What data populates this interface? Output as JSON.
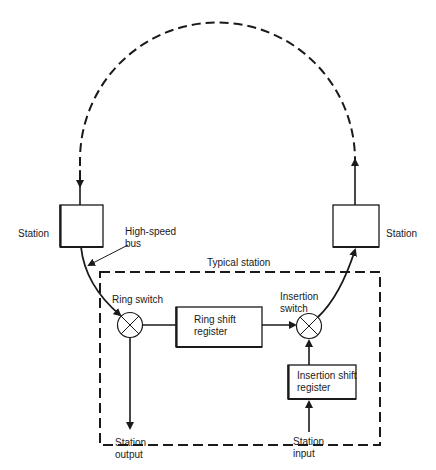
{
  "diagram": {
    "type": "ring network block diagram",
    "labels": {
      "station_left": "Station",
      "station_right": "Station",
      "high_speed_bus": "High-speed\nbus",
      "typical_station": "Typical station",
      "ring_switch": "Ring switch",
      "ring_shift_register": "Ring shift\nregister",
      "insertion_switch": "Insertion\nswitch",
      "insertion_shift_register": "Insertion shift\nregister",
      "station_output": "Station\noutput",
      "station_input": "Station\ninput"
    },
    "colors": {
      "line": "#1a1a1a",
      "background": "#ffffff"
    }
  }
}
